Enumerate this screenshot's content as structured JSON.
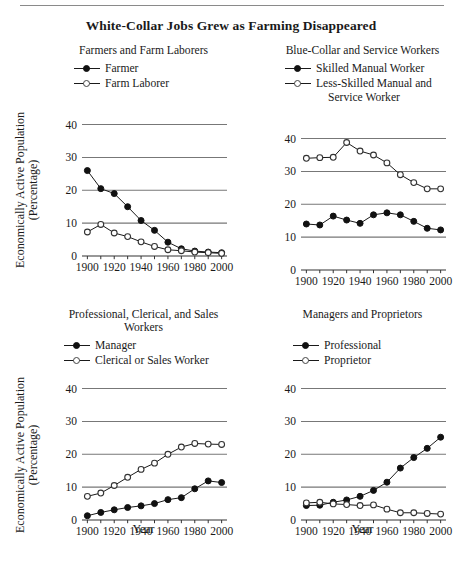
{
  "figure": {
    "title": "White-Collar Jobs Grew as Farming Disappeared",
    "y_axis_label_line1": "Economically Active Population",
    "y_axis_label_line2": "(Percentage)",
    "x_axis_label": "Year"
  },
  "chart_data": [
    {
      "id": "farmers",
      "type": "line",
      "title": "Farmers and Farm Laborers",
      "xlabel": "Year",
      "ylabel": "Economically Active Population (Percentage)",
      "x": [
        1900,
        1910,
        1920,
        1930,
        1940,
        1950,
        1960,
        1970,
        1980,
        1990,
        2000
      ],
      "xtick_labels": [
        "1900",
        "1920",
        "1940",
        "1960",
        "1980",
        "2000"
      ],
      "xticks": [
        1900,
        1920,
        1940,
        1960,
        1980,
        2000
      ],
      "yticks": [
        0,
        10,
        20,
        30,
        40
      ],
      "ylim": [
        0,
        42
      ],
      "xlim": [
        1896,
        2004
      ],
      "grid": "horizontal",
      "legend_position": "above-plot",
      "series": [
        {
          "name": "Farmer",
          "marker": "filled-circle",
          "values": [
            26.0,
            20.5,
            19.0,
            15.0,
            10.8,
            7.8,
            4.2,
            2.2,
            1.5,
            1.2,
            1.0
          ]
        },
        {
          "name": "Farm Laborer",
          "marker": "open-circle",
          "values": [
            7.3,
            9.6,
            7.0,
            5.9,
            4.3,
            2.9,
            1.9,
            1.6,
            1.2,
            1.0,
            0.8
          ]
        }
      ]
    },
    {
      "id": "blue-collar",
      "type": "line",
      "title": "Blue-Collar and Service Workers",
      "xlabel": "Year",
      "ylabel": "Economically Active Population (Percentage)",
      "x": [
        1900,
        1910,
        1920,
        1930,
        1940,
        1950,
        1960,
        1970,
        1980,
        1990,
        2000
      ],
      "xtick_labels": [
        "1900",
        "1920",
        "1940",
        "1960",
        "1980",
        "2000"
      ],
      "xticks": [
        1900,
        1920,
        1940,
        1960,
        1980,
        2000
      ],
      "yticks": [
        0,
        10,
        20,
        30,
        40
      ],
      "ylim": [
        0,
        42
      ],
      "xlim": [
        1896,
        2004
      ],
      "grid": "horizontal",
      "legend_position": "above-plot",
      "series": [
        {
          "name": "Skilled Manual Worker",
          "marker": "filled-circle",
          "values": [
            14.0,
            13.7,
            16.4,
            15.2,
            14.2,
            16.8,
            17.4,
            16.8,
            14.8,
            12.7,
            12.2
          ]
        },
        {
          "name": "Less-Skilled Manual and Service Worker",
          "marker": "open-circle",
          "values": [
            34.0,
            34.2,
            34.3,
            38.8,
            36.2,
            35.0,
            32.6,
            29.0,
            26.6,
            24.7,
            24.7
          ]
        }
      ]
    },
    {
      "id": "professional-clerical",
      "type": "line",
      "title": "Professional, Clerical, and Sales Workers",
      "xlabel": "Year",
      "ylabel": "Economically Active Population (Percentage)",
      "x": [
        1900,
        1910,
        1920,
        1930,
        1940,
        1950,
        1960,
        1970,
        1980,
        1990,
        2000
      ],
      "xtick_labels": [
        "1900",
        "1920",
        "1940",
        "1960",
        "1980",
        "2000"
      ],
      "xticks": [
        1900,
        1920,
        1940,
        1960,
        1980,
        2000
      ],
      "yticks": [
        0,
        10,
        20,
        30,
        40
      ],
      "ylim": [
        0,
        42
      ],
      "xlim": [
        1896,
        2004
      ],
      "grid": "horizontal",
      "legend_position": "above-plot",
      "series": [
        {
          "name": "Manager",
          "marker": "filled-circle",
          "values": [
            1.3,
            2.3,
            3.1,
            3.8,
            4.3,
            5.0,
            6.2,
            6.8,
            9.5,
            11.9,
            11.4
          ]
        },
        {
          "name": "Clerical or Sales Worker",
          "marker": "open-circle",
          "values": [
            7.2,
            8.2,
            10.5,
            13.0,
            15.4,
            17.3,
            20.0,
            22.2,
            23.3,
            23.1,
            23.0
          ]
        }
      ]
    },
    {
      "id": "managers-proprietors",
      "type": "line",
      "title": "Managers and Proprietors",
      "xlabel": "Year",
      "ylabel": "Economically Active Population (Percentage)",
      "x": [
        1900,
        1910,
        1920,
        1930,
        1940,
        1950,
        1960,
        1970,
        1980,
        1990,
        2000
      ],
      "xtick_labels": [
        "1900",
        "1920",
        "1940",
        "1960",
        "1980",
        "2000"
      ],
      "xticks": [
        1900,
        1920,
        1940,
        1960,
        1980,
        2000
      ],
      "yticks": [
        0,
        10,
        20,
        30,
        40
      ],
      "ylim": [
        0,
        42
      ],
      "xlim": [
        1896,
        2004
      ],
      "grid": "horizontal",
      "legend_position": "above-plot",
      "series": [
        {
          "name": "Professional",
          "marker": "filled-circle",
          "values": [
            4.4,
            4.5,
            5.4,
            6.1,
            7.2,
            9.0,
            11.5,
            15.8,
            19.0,
            21.8,
            25.2
          ]
        },
        {
          "name": "Proprietor",
          "marker": "open-circle",
          "values": [
            5.2,
            5.4,
            4.9,
            4.7,
            4.4,
            4.6,
            3.3,
            2.2,
            2.2,
            2.0,
            1.8
          ]
        }
      ]
    }
  ],
  "colors": {
    "ink": "#1a1a1a",
    "gridline": "#777777",
    "axis": "#333333",
    "marker_fill": "#111111",
    "marker_open": "#ffffff",
    "rule": "#8a8a8a"
  }
}
